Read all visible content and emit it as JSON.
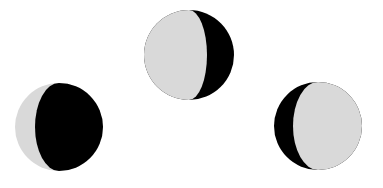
{
  "diagram": {
    "colors": {
      "lit": "#d9d9d9",
      "dark": "#000000",
      "background": "#ffffff"
    },
    "moons": [
      {
        "name": "waxing-crescent-dark",
        "cx": 59,
        "cy": 127,
        "r": 44,
        "dark_side": "right",
        "terminator_offset": -24,
        "label": ""
      },
      {
        "name": "waxing-gibbous",
        "cx": 189,
        "cy": 55,
        "r": 45,
        "dark_side": "right",
        "terminator_offset": 18,
        "label": ""
      },
      {
        "name": "waning-gibbous",
        "cx": 318,
        "cy": 126,
        "r": 44,
        "dark_side": "left",
        "terminator_offset": -25,
        "label": ""
      }
    ]
  }
}
